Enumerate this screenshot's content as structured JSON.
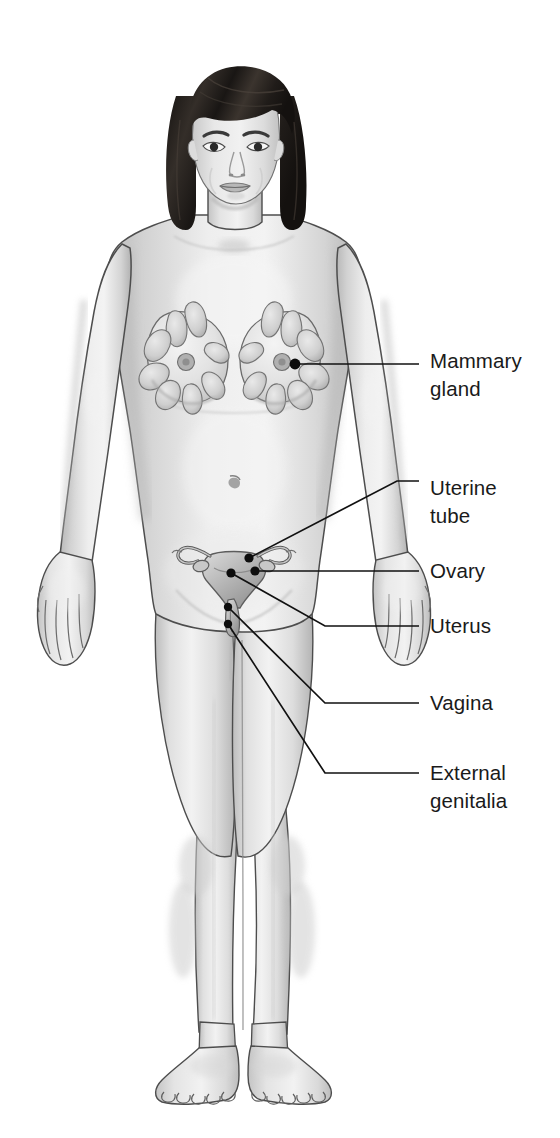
{
  "illustration": {
    "title": "Female reproductive system overview",
    "subject": "anterior view of female body with reproductive organs",
    "background_color": "#ffffff",
    "figure_skin_color": "#dcdcdc",
    "hair_color": "#1f1c1a",
    "outline_color": "#4a4a4a",
    "leader_line_color": "#111111",
    "label_text_color": "#1a1a1a"
  },
  "labels": [
    {
      "id": "mammary-gland",
      "line1": "Mammary",
      "line2": "gland",
      "text_x": 430,
      "text_y": 368,
      "anchor_x": 295,
      "anchor_y": 364,
      "elbow_x": 400,
      "elbow_y": 364,
      "end_x": 419,
      "end_y": 364
    },
    {
      "id": "uterine-tube",
      "line1": "Uterine",
      "line2": "tube",
      "text_x": 430,
      "text_y": 495,
      "anchor_x": 249,
      "anchor_y": 558,
      "elbow_x": 397,
      "elbow_y": 481,
      "end_x": 419,
      "end_y": 481
    },
    {
      "id": "ovary",
      "line1": "Ovary",
      "line2": "",
      "text_x": 430,
      "text_y": 578,
      "anchor_x": 255,
      "anchor_y": 571,
      "elbow_x": 400,
      "elbow_y": 571,
      "end_x": 419,
      "end_y": 571
    },
    {
      "id": "uterus",
      "line1": "Uterus",
      "line2": "",
      "text_x": 430,
      "text_y": 633,
      "anchor_x": 231,
      "anchor_y": 573,
      "elbow_x": 325,
      "elbow_y": 626,
      "end_x": 419,
      "end_y": 626
    },
    {
      "id": "vagina",
      "line1": "Vagina",
      "line2": "",
      "text_x": 430,
      "text_y": 710,
      "anchor_x": 228,
      "anchor_y": 607,
      "elbow_x": 325,
      "elbow_y": 703,
      "end_x": 419,
      "end_y": 703
    },
    {
      "id": "external-genitalia",
      "line1": "External",
      "line2": "genitalia",
      "text_x": 430,
      "text_y": 780,
      "anchor_x": 228,
      "anchor_y": 624,
      "elbow_x": 325,
      "elbow_y": 773,
      "end_x": 419,
      "end_y": 773
    }
  ],
  "body_parts": [
    {
      "id": "head",
      "name": "head"
    },
    {
      "id": "hair",
      "name": "bobbed hair"
    },
    {
      "id": "face",
      "name": "face"
    },
    {
      "id": "neck",
      "name": "neck"
    },
    {
      "id": "torso",
      "name": "torso"
    },
    {
      "id": "left-breast",
      "name": "left breast"
    },
    {
      "id": "right-breast",
      "name": "right breast"
    },
    {
      "id": "left-arm",
      "name": "left arm"
    },
    {
      "id": "right-arm",
      "name": "right arm"
    },
    {
      "id": "left-hand",
      "name": "left hand"
    },
    {
      "id": "right-hand",
      "name": "right hand"
    },
    {
      "id": "left-leg",
      "name": "left leg"
    },
    {
      "id": "right-leg",
      "name": "right leg"
    },
    {
      "id": "left-foot",
      "name": "left foot"
    },
    {
      "id": "right-foot",
      "name": "right foot"
    },
    {
      "id": "navel",
      "name": "navel"
    }
  ],
  "organ_overlay": {
    "name": "uterus-and-adnexa",
    "parts": [
      "uterine body",
      "left uterine tube",
      "right uterine tube",
      "left ovary",
      "right ovary",
      "cervix",
      "vagina"
    ]
  }
}
